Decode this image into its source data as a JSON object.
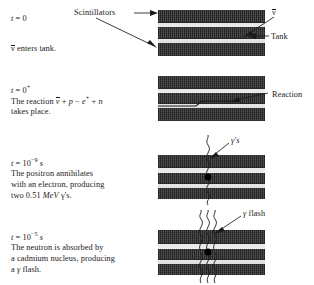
{
  "figure": {
    "colors": {
      "ink": "#1a1a1a",
      "scintillator": "#666666",
      "water": "#dcdcdc",
      "background": "#ffffff"
    }
  },
  "panels": [
    {
      "id": "panel-1",
      "time_label": "t = 0",
      "time_prefix": "t",
      "time_equals": "=",
      "time_value": "0",
      "time_exponent": "",
      "time_unit": "",
      "caption_lines": [
        "ν̅ enters tank."
      ],
      "caption_plain": "v̄ enters tank.",
      "annotations": [
        {
          "name": "scintillators-label",
          "text": "Scintillators"
        },
        {
          "name": "tank-label",
          "text": "Tank"
        },
        {
          "name": "antineutrino-label",
          "text": "ν̅"
        }
      ]
    },
    {
      "id": "panel-2",
      "time_label": "t = 0+",
      "time_prefix": "t",
      "time_equals": "=",
      "time_value": "0",
      "time_exponent": "+",
      "time_unit": "",
      "caption_lines": [
        "The reaction ν̅ + p − e+ + n",
        "takes place."
      ],
      "reaction_intro": "The reaction",
      "reaction_nu": "ν",
      "reaction_rest": "+ p − e",
      "reaction_positron_sup": "+",
      "reaction_tail": "+ n",
      "caption_last": "takes place.",
      "annotations": [
        {
          "name": "reaction-label",
          "text": "Reaction"
        }
      ]
    },
    {
      "id": "panel-3",
      "time_label": "t = 10-9 s",
      "time_prefix": "t",
      "time_equals": "=",
      "time_value": "10",
      "time_exponent": "−9",
      "time_unit": "s",
      "caption_lines": [
        "The positron annihilates",
        "with an electron, producing",
        "two 0.51 MeV γ's."
      ],
      "line1": "The positron annihilates",
      "line2": "with an electron, producing",
      "line3_a": "two 0.51",
      "line3_unit": "MeV",
      "line3_b": "γ's.",
      "annotations": [
        {
          "name": "gammas-label",
          "text": "γ's"
        }
      ]
    },
    {
      "id": "panel-4",
      "time_label": "t = 10-5 s",
      "time_prefix": "t",
      "time_equals": "=",
      "time_value": "10",
      "time_exponent": "−5",
      "time_unit": "s",
      "caption_lines": [
        "The neutron is absorbed by",
        "a cadmium nucleus, producing",
        "a γ flash."
      ],
      "line1": "The neutron is absorbed by",
      "line2": "a cadmium nucleus, producing",
      "line3_a": "a",
      "line3_gamma": "γ",
      "line3_b": "flash.",
      "annotations": [
        {
          "name": "gamma-flash-label",
          "text": "γ flash"
        }
      ]
    }
  ]
}
